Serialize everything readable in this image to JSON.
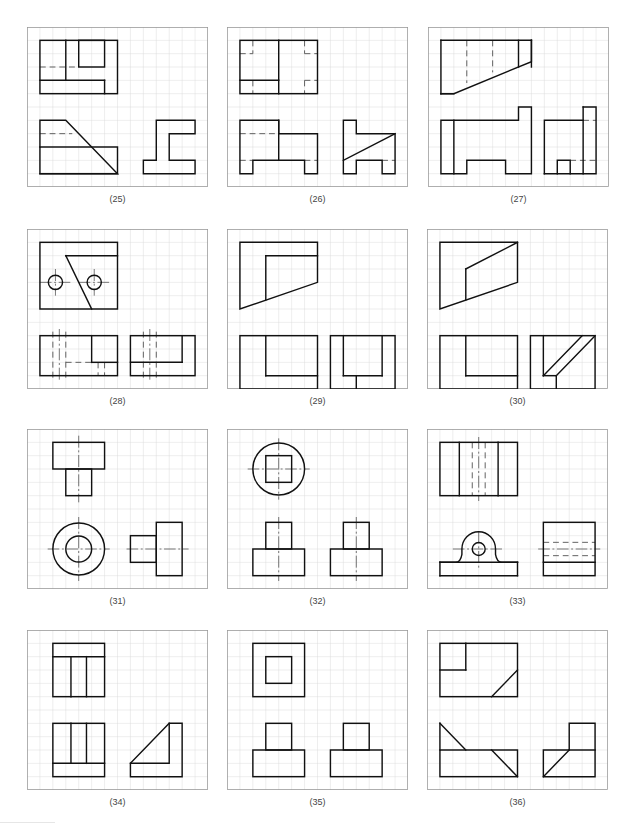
{
  "page": {
    "grid": {
      "cols": 14,
      "rows": 12,
      "line_color": "#d9d9d9",
      "frame_color": "#9a9a9a"
    },
    "colors": {
      "object_line": "#111111",
      "hidden_line": "#555555",
      "center_line": "#333333",
      "label_text": "#444444"
    }
  },
  "panels": [
    {
      "id": "25",
      "label": "(25)",
      "x": 27,
      "y": 27,
      "rects": [
        [
          1,
          1,
          6,
          4
        ],
        [
          4,
          1,
          2,
          2
        ],
        [
          1,
          9,
          6,
          2
        ]
      ],
      "lines": [
        [
          3,
          1,
          3,
          4
        ],
        [
          1,
          4,
          6,
          4
        ],
        [
          6,
          4,
          6,
          5
        ]
      ],
      "polylines": [
        [
          [
            1,
            9
          ],
          [
            1,
            7
          ],
          [
            3,
            7
          ],
          [
            7,
            11
          ],
          [
            1,
            11
          ]
        ],
        [
          [
            9,
            11
          ],
          [
            13,
            11
          ],
          [
            13,
            10
          ],
          [
            11,
            10
          ],
          [
            11,
            8
          ],
          [
            13,
            8
          ],
          [
            13,
            7
          ],
          [
            10,
            7
          ],
          [
            10,
            10
          ],
          [
            9,
            10
          ],
          [
            9,
            11
          ]
        ]
      ],
      "hidden": [
        [
          1,
          3,
          4,
          3
        ],
        [
          1,
          8,
          3.5,
          8
        ]
      ],
      "centers": [],
      "circles": [],
      "paths": []
    },
    {
      "id": "26",
      "label": "(26)",
      "x": 227,
      "y": 27,
      "rects": [
        [
          1,
          1,
          6,
          4
        ]
      ],
      "lines": [
        [
          4,
          1,
          4,
          5
        ],
        [
          1,
          4,
          4,
          4
        ]
      ],
      "polylines": [
        [
          [
            1,
            7
          ],
          [
            4,
            7
          ],
          [
            4,
            8
          ],
          [
            7,
            8
          ],
          [
            7,
            11
          ],
          [
            6,
            11
          ],
          [
            6,
            10
          ],
          [
            2,
            10
          ],
          [
            2,
            11
          ],
          [
            1,
            11
          ],
          [
            1,
            7
          ]
        ],
        [
          [
            9,
            7
          ],
          [
            10,
            7
          ],
          [
            10,
            8
          ],
          [
            13,
            8
          ],
          [
            13,
            11
          ],
          [
            12,
            11
          ],
          [
            12,
            10
          ],
          [
            10,
            10
          ],
          [
            10,
            11
          ],
          [
            9,
            11
          ],
          [
            9,
            7
          ]
        ]
      ],
      "straight": [
        [
          4,
          7,
          4,
          10
        ],
        [
          9,
          10,
          13,
          8
        ]
      ],
      "hidden": [
        [
          2,
          1,
          2,
          2
        ],
        [
          1,
          2,
          2,
          2
        ],
        [
          6,
          1,
          6,
          2
        ],
        [
          6,
          2,
          7,
          2
        ],
        [
          2,
          4,
          2,
          5
        ],
        [
          6,
          4,
          6,
          5
        ],
        [
          6,
          4,
          7,
          4
        ],
        [
          1,
          8,
          4,
          8
        ],
        [
          1,
          10,
          2,
          10
        ],
        [
          6,
          10,
          7,
          10
        ],
        [
          12,
          10,
          13,
          10
        ]
      ],
      "centers": [],
      "circles": [],
      "paths": []
    },
    {
      "id": "27",
      "label": "(27)",
      "x": 428,
      "y": 27,
      "rects": [],
      "lines": [
        [
          1,
          1,
          1,
          5
        ],
        [
          1,
          5,
          2,
          5
        ],
        [
          8,
          1,
          8,
          3
        ],
        [
          1,
          1,
          8,
          1
        ]
      ],
      "polylines": [
        [
          [
            1,
            5
          ],
          [
            2,
            5
          ],
          [
            8,
            2.6
          ],
          [
            8,
            1
          ]
        ],
        [
          [
            7,
            1
          ],
          [
            7,
            3
          ]
        ],
        [
          [
            1,
            11
          ],
          [
            1,
            7
          ],
          [
            7,
            7
          ],
          [
            7,
            6
          ],
          [
            8,
            6
          ],
          [
            8,
            11
          ],
          [
            6,
            11
          ],
          [
            6,
            10
          ],
          [
            3,
            10
          ],
          [
            3,
            11
          ],
          [
            1,
            11
          ]
        ],
        [
          [
            2,
            7
          ],
          [
            2,
            11
          ]
        ],
        [
          [
            9,
            11
          ],
          [
            9,
            7
          ],
          [
            12,
            7
          ]
        ],
        [
          [
            12,
            6
          ],
          [
            13,
            6
          ],
          [
            13,
            11
          ],
          [
            9,
            11
          ]
        ],
        [
          [
            12,
            6
          ],
          [
            12,
            11
          ]
        ],
        [
          [
            10,
            11
          ],
          [
            10,
            10
          ],
          [
            11,
            10
          ],
          [
            11,
            11
          ]
        ]
      ],
      "hidden": [
        [
          3,
          1,
          3,
          4.2
        ],
        [
          5,
          1,
          5,
          3.4
        ],
        [
          12,
          7,
          13,
          7
        ],
        [
          11,
          10,
          13,
          10
        ]
      ],
      "centers": [],
      "circles": [],
      "paths": []
    },
    {
      "id": "28",
      "label": "(28)",
      "x": 27,
      "y": 229,
      "rects": [
        [
          1,
          1,
          6,
          5
        ],
        [
          1,
          8,
          6,
          3
        ],
        [
          8,
          8,
          5,
          3
        ]
      ],
      "lines": [
        [
          3,
          2,
          7,
          2
        ],
        [
          3,
          2,
          5,
          6
        ],
        [
          5,
          8,
          5,
          10
        ],
        [
          5,
          10,
          7,
          10
        ],
        [
          12,
          8,
          12,
          10
        ],
        [
          8,
          10,
          12,
          10
        ]
      ],
      "polylines": [],
      "hidden": [
        [
          2,
          7.7,
          2,
          11.3
        ],
        [
          3,
          7.7,
          3,
          11.3
        ],
        [
          3,
          10,
          5,
          10
        ],
        [
          5.5,
          10,
          5.5,
          11
        ],
        [
          6,
          10,
          6,
          11
        ],
        [
          9,
          7.7,
          9,
          11.3
        ],
        [
          10,
          7.7,
          10,
          11.3
        ]
      ],
      "centers": [
        [
          1,
          4,
          3.5,
          4
        ],
        [
          2.2,
          3,
          2.2,
          5
        ],
        [
          4,
          4,
          6.5,
          4
        ],
        [
          5.2,
          3,
          5.2,
          5
        ],
        [
          2.5,
          7.5,
          2.5,
          11.5
        ],
        [
          9.5,
          7.5,
          9.5,
          11.5
        ]
      ],
      "circles": [
        [
          2.2,
          4,
          0.55
        ],
        [
          5.2,
          4,
          0.55
        ]
      ],
      "paths": []
    },
    {
      "id": "29",
      "label": "(29)",
      "x": 227,
      "y": 229,
      "rects": [
        [
          1,
          8,
          6,
          4
        ],
        [
          8,
          8,
          5,
          4
        ]
      ],
      "lines": [
        [
          3,
          2,
          7,
          2
        ],
        [
          3,
          2,
          3,
          5.3
        ],
        [
          3,
          8,
          3,
          11
        ],
        [
          3,
          11,
          7,
          11
        ],
        [
          9,
          8,
          9,
          11
        ],
        [
          9,
          11,
          12,
          11
        ],
        [
          12,
          8,
          12,
          11
        ],
        [
          10,
          11,
          10,
          12
        ]
      ],
      "polylines": [
        [
          [
            1,
            1
          ],
          [
            7,
            1
          ],
          [
            7,
            4
          ],
          [
            1,
            6
          ],
          [
            1,
            1
          ]
        ]
      ],
      "hidden": [],
      "centers": [],
      "circles": [],
      "paths": []
    },
    {
      "id": "30",
      "label": "(30)",
      "x": 427,
      "y": 229,
      "rects": [
        [
          1,
          8,
          6,
          4
        ],
        [
          8,
          8,
          5,
          4
        ]
      ],
      "lines": [
        [
          3,
          3,
          3,
          5.3
        ],
        [
          3,
          3,
          7,
          1
        ],
        [
          3,
          8,
          3,
          11
        ],
        [
          3,
          11,
          7,
          11
        ],
        [
          9,
          8,
          9,
          11
        ],
        [
          9,
          11,
          10,
          11
        ],
        [
          10,
          11,
          10,
          12
        ],
        [
          9,
          11,
          12,
          8
        ],
        [
          10,
          11,
          13,
          8
        ]
      ],
      "polylines": [
        [
          [
            1,
            1
          ],
          [
            7,
            1
          ],
          [
            7,
            4
          ],
          [
            1,
            6
          ],
          [
            1,
            1
          ]
        ]
      ],
      "hidden": [],
      "centers": [],
      "circles": [],
      "paths": []
    },
    {
      "id": "31",
      "label": "(31)",
      "x": 27,
      "y": 429,
      "rects": [
        [
          2,
          1,
          4,
          2
        ],
        [
          3,
          3,
          2,
          2
        ],
        [
          8,
          8,
          2,
          2
        ],
        [
          10,
          7,
          2,
          4
        ]
      ],
      "lines": [],
      "polylines": [],
      "hidden": [],
      "centers": [
        [
          4,
          0.5,
          4,
          5.5
        ],
        [
          1.6,
          9,
          6.4,
          9
        ],
        [
          4,
          6.6,
          4,
          11.4
        ],
        [
          7.7,
          9,
          12.5,
          9
        ]
      ],
      "circles": [
        [
          4,
          9,
          2
        ],
        [
          4,
          9,
          1
        ]
      ],
      "paths": []
    },
    {
      "id": "32",
      "label": "(32)",
      "x": 227,
      "y": 429,
      "rects": [
        [
          3,
          2,
          2,
          2
        ],
        [
          2,
          9,
          4,
          2
        ],
        [
          3,
          7,
          2,
          2
        ],
        [
          8,
          9,
          4,
          2
        ],
        [
          9,
          7,
          2,
          2
        ]
      ],
      "lines": [],
      "polylines": [],
      "hidden": [],
      "centers": [
        [
          1.6,
          3,
          6.4,
          3
        ],
        [
          4,
          0.7,
          4,
          5.3
        ],
        [
          4,
          6.6,
          4,
          11.4
        ],
        [
          10,
          6.6,
          10,
          11.4
        ]
      ],
      "circles": [
        [
          4,
          3,
          2
        ]
      ],
      "paths": []
    },
    {
      "id": "33",
      "label": "(33)",
      "x": 427,
      "y": 429,
      "rects": [
        [
          1,
          1,
          6,
          4
        ],
        [
          9,
          7,
          4,
          4
        ]
      ],
      "lines": [
        [
          2.5,
          1,
          2.5,
          5
        ],
        [
          5.5,
          1,
          5.5,
          5
        ],
        [
          1,
          10,
          7,
          10
        ],
        [
          7,
          10,
          7,
          11
        ],
        [
          1,
          11,
          7,
          11
        ],
        [
          1,
          10,
          1,
          11
        ],
        [
          9,
          10,
          13,
          10
        ]
      ],
      "polylines": [],
      "hidden": [
        [
          3.5,
          1,
          3.5,
          5
        ],
        [
          4.5,
          1,
          4.5,
          5
        ],
        [
          9,
          8.5,
          13,
          8.5
        ],
        [
          9,
          9.5,
          13,
          9.5
        ]
      ],
      "centers": [
        [
          4,
          0.6,
          4,
          5.4
        ],
        [
          2,
          9,
          6,
          9
        ],
        [
          4,
          7.7,
          4,
          10.5
        ],
        [
          8.6,
          9,
          13.4,
          9
        ]
      ],
      "circles": [
        [
          4,
          9,
          0.5
        ]
      ],
      "paths": [
        "M1 10 L2.2 10 Q2.6 10 2.7 9.4 L2.7 9 A1.3 1.3 0 0 1 5.3 9 L5.3 9.4 Q5.4 10 5.8 10 L7 10"
      ]
    },
    {
      "id": "34",
      "label": "(34)",
      "x": 27,
      "y": 630,
      "rects": [
        [
          2,
          1,
          4,
          4
        ],
        [
          2,
          7,
          4,
          4
        ]
      ],
      "lines": [
        [
          2,
          2,
          6,
          2
        ],
        [
          3.4,
          2,
          3.4,
          5
        ],
        [
          4.6,
          2,
          4.6,
          5
        ],
        [
          3.4,
          7,
          3.4,
          10
        ],
        [
          4.6,
          7,
          4.6,
          10
        ],
        [
          2,
          10,
          6,
          10
        ]
      ],
      "polylines": [
        [
          [
            8,
            11
          ],
          [
            8,
            10
          ],
          [
            11,
            7
          ],
          [
            12,
            7
          ],
          [
            12,
            11
          ],
          [
            8,
            11
          ]
        ],
        [
          [
            8,
            10
          ],
          [
            11,
            10
          ],
          [
            11,
            7
          ]
        ]
      ],
      "hidden": [],
      "centers": [],
      "circles": [],
      "paths": []
    },
    {
      "id": "35",
      "label": "(35)",
      "x": 227,
      "y": 630,
      "rects": [
        [
          2,
          1,
          4,
          4
        ],
        [
          3,
          2,
          2,
          2
        ],
        [
          2,
          9,
          4,
          2
        ],
        [
          3,
          7,
          2,
          2
        ],
        [
          8,
          9,
          4,
          2
        ],
        [
          9,
          7,
          2,
          2
        ]
      ],
      "lines": [],
      "polylines": [],
      "hidden": [],
      "centers": [],
      "circles": [],
      "paths": []
    },
    {
      "id": "36",
      "label": "(36)",
      "x": 427,
      "y": 630,
      "rects": [
        [
          1,
          1,
          6,
          4
        ],
        [
          1,
          9,
          6,
          2
        ]
      ],
      "lines": [
        [
          3,
          1,
          3,
          3
        ],
        [
          1,
          3,
          3,
          3
        ],
        [
          5,
          5,
          7,
          3
        ],
        [
          1,
          7,
          3,
          9
        ],
        [
          5,
          9,
          7,
          11
        ]
      ],
      "polylines": [
        [
          [
            1,
            9
          ],
          [
            1,
            7
          ]
        ],
        [
          [
            9,
            11
          ],
          [
            9,
            9
          ],
          [
            11,
            9
          ],
          [
            11,
            7
          ],
          [
            13,
            7
          ],
          [
            13,
            11
          ],
          [
            9,
            11
          ]
        ],
        [
          [
            11,
            9
          ],
          [
            13,
            9
          ]
        ],
        [
          [
            9,
            11
          ],
          [
            11,
            9
          ]
        ]
      ],
      "hidden": [],
      "centers": [],
      "circles": [],
      "paths": []
    }
  ]
}
